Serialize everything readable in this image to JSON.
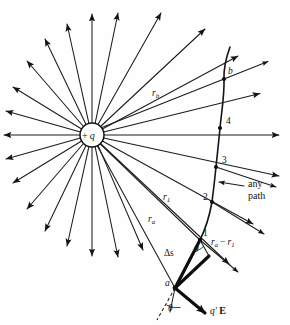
{
  "figure": {
    "name": "point-charge-radial-field-with-path",
    "background_color": "#fefefe",
    "ink_color": "#141414",
    "width": 290,
    "height": 325
  },
  "charge": {
    "label_sign": "+",
    "label_symbol": "q",
    "center_x": 92,
    "center_y": 135,
    "radius": 12
  },
  "field": {
    "ray_count": 24,
    "angle_step_degrees": 15,
    "description": "radial electric field lines pointing outward from positive charge"
  },
  "path_points": [
    {
      "id": "b",
      "label": "b",
      "x": 224,
      "y": 79
    },
    {
      "id": "4",
      "label": "4",
      "x": 220,
      "y": 128
    },
    {
      "id": "3",
      "label": "3",
      "x": 216,
      "y": 167
    },
    {
      "id": "2",
      "label": "2",
      "x": 212,
      "y": 202
    },
    {
      "id": "1",
      "label": "1",
      "x": 200,
      "y": 240
    },
    {
      "id": "a",
      "label": "a",
      "x": 175,
      "y": 288
    }
  ],
  "radial_labels": [
    {
      "name": "r-b",
      "base": "r",
      "sub": "b",
      "x": 152,
      "y": 96
    },
    {
      "name": "r-1",
      "base": "r",
      "sub": "1",
      "x": 163,
      "y": 200
    },
    {
      "name": "r-a",
      "base": "r",
      "sub": "a",
      "x": 148,
      "y": 222
    }
  ],
  "annotations": {
    "any_path_line1": "any",
    "any_path_line2": "path",
    "delta_s": "Δs",
    "difference_base": "r",
    "difference_sub_a": "a",
    "difference_minus": "−",
    "difference_sub_1": "1",
    "difference_full": "rₐ − r₁",
    "theta_upper": "θ",
    "theta_lower": "θ",
    "force_vector": "q′ E",
    "force_prime": "q′",
    "force_field": "E"
  }
}
